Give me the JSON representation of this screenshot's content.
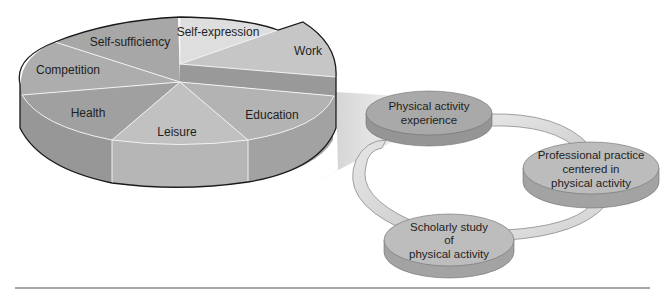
{
  "pie": {
    "title": "",
    "segments": [
      {
        "label": "Self-expression"
      },
      {
        "label": "Work"
      },
      {
        "label": "Education"
      },
      {
        "label": "Leisure"
      },
      {
        "label": "Health"
      },
      {
        "label": "Competition"
      },
      {
        "label": "Self-sufficiency"
      }
    ],
    "exploded_segment": "Work"
  },
  "cycle": {
    "nodes": [
      {
        "line1": "Physical activity",
        "line2": "experience"
      },
      {
        "line1": "Professional practice",
        "line2": "centered in",
        "line3": "physical activity"
      },
      {
        "line1": "Scholarly study",
        "line2": "of",
        "line3": "physical activity"
      }
    ]
  },
  "colors": {
    "background": "#ffffff",
    "self_expression": "#dcdcdc",
    "work": "#c4c4c4",
    "education": "#b2b2b2",
    "leisure": "#c0c0c0",
    "health": "#a2a2a2",
    "competition": "#acacac",
    "self_sufficiency": "#a6a6a6",
    "outline": "#1a1a1a",
    "node_top": "#a9a9a9",
    "node_side": "#989898",
    "ring": "#d8d8d8",
    "rule": "#8a8a8a"
  }
}
